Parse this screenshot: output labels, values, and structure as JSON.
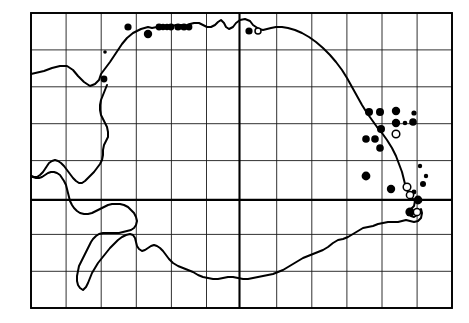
{
  "figure": {
    "name": "species-distribution-map",
    "width": 469,
    "height": 323,
    "background_color": "#ffffff",
    "line_color": "#000000"
  },
  "graticule": {
    "columns": 12,
    "rows": 8,
    "left": 31,
    "top": 13,
    "right": 452,
    "bottom": 308,
    "cell_width": 35.1,
    "cell_height": 36.9,
    "minor_color": "#1a1a1a",
    "major_color": "#000000",
    "major_vertical_x": [
      239.5
    ],
    "major_horizontal_y": [
      199.9
    ],
    "x_lines": [
      31,
      66.1,
      101.2,
      136.3,
      171.4,
      206.5,
      239.5,
      276.7,
      311.8,
      346.9,
      382.0,
      417.1,
      452
    ],
    "y_lines": [
      13,
      49.9,
      86.8,
      123.7,
      160.6,
      199.9,
      234.4,
      271.3,
      308
    ]
  },
  "coastline": {
    "name": "landmass-outline",
    "stroke_width": 2.0,
    "path": "M 31 74 L 44 71 L 52 68 L 60 66 L 67 66 L 73 70 L 78 76 L 84 82 L 90 86 L 95 84 L 99 80 L 101 74 L 104 70 L 107 66 L 110 62 L 114 56 L 118 50 L 122 44 L 127 38 L 133 33 L 141 29 L 148 27 L 152 28 L 157 27 L 163 26 L 168 27 L 172 26 L 176 25 L 181 25 L 186 26 L 190 24 L 194 23 L 199 23 L 203 25 L 207 27 L 211 27 L 215 25 L 218 22 L 221 20 L 224 23 L 226 27 L 229 29 L 233 27 L 236 23 L 240 20 L 245 19 L 250 21 L 253 25 L 256 27 L 259 29 L 263 30 L 267 29 L 271 28 L 276 27 L 282 27 L 288 28 L 295 30 L 302 33 L 309 37 L 316 42 L 323 48 L 330 55 L 336 62 L 342 70 L 347 78 L 352 87 L 357 96 L 362 105 L 367 113 L 372 120 L 377 127 L 382 133 L 387 140 L 392 148 L 396 156 L 399 164 L 402 172 L 404 180 L 406 188 L 409 194 L 412 198 L 415 201 L 414 206 L 411 209 L 409 213 L 411 216 L 414 217 L 417 215 L 419 212 L 421 209 L 422 213 L 421 218 L 418 221 L 414 222 L 410 221 L 406 220 L 402 221 L 398 222 L 393 222 L 388 222 L 383 223 L 378 224 L 373 226 L 368 227 L 363 228 L 358 231 L 353 234 L 348 237 L 343 239 L 338 240 L 333 243 L 328 247 L 323 250 L 318 252 L 313 254 L 308 256 L 303 258 L 298 261 L 293 264 L 288 267 L 283 270 L 278 272 L 273 274 L 268 275 L 263 276 L 258 277 L 253 278 L 248 279 L 243 279 L 238 278 L 233 277 L 228 277 L 223 278 L 218 279 L 213 279 L 208 278 L 203 277 L 198 275 L 193 272 L 188 270 L 183 268 L 178 266 L 173 263 L 169 259 L 166 255 L 163 251 L 160 248 L 157 246 L 154 245 L 151 246 L 148 248 L 145 250 L 142 251 L 139 249 L 137 246 L 136 242 L 135 238 L 133 235 L 130 234 L 126 235 L 122 237 L 118 240 L 114 244 L 110 248 L 106 253 L 102 258 L 98 263 L 95 268 L 92 273 L 90 278 L 88 283 L 86 287 L 83 290 L 80 288 L 78 285 L 77 281 L 77 276 L 78 271 L 79 266 L 81 262 L 83 258 L 85 254 L 87 250 L 89 246 L 91 242 L 93 239 L 96 236 L 99 234 L 103 233 L 107 233 L 111 233 L 115 233 L 119 233 L 123 232 L 127 231 L 131 230 L 134 228 L 136 225 L 137 221 L 136 217 L 134 213 L 131 210 L 128 207 L 124 205 L 120 204 L 116 204 L 112 204 L 108 205 L 104 207 L 100 209 L 96 211 L 92 213 L 88 214 L 84 214 L 80 213 L 77 211 L 74 208 L 72 205 L 70 201 L 69 197 L 68 193 L 67 189 L 66 185 L 64 181 L 62 178 L 60 175 L 57 173 L 54 172 L 51 172 L 48 173 L 45 175 L 42 177 L 39 178 L 36 178 L 33 177 L 31 176",
    "coastline_inland_path": "M 31 176 L 34 177 L 37 177 L 40 175 L 43 172 L 45 169 L 47 166 L 49 163 L 52 161 L 55 160 L 58 161 L 61 163 L 64 166 L 67 170 L 70 174 L 73 178 L 76 181 L 79 183 L 82 183 L 85 181 L 88 178 L 91 175 L 94 172 L 97 168 L 100 164 L 102 160 L 103 155 L 103 150 L 104 145 L 106 141 L 108 137 L 108 132 L 107 127 L 105 123 L 103 119 L 101 115 L 100 110 L 100 105 L 101 100 L 103 95 L 105 90 L 107 85"
  },
  "points": {
    "filled_label": "filled-circle-record",
    "open_label": "open-circle-record",
    "filled_color": "#000000",
    "open_fill_color": "#ffffff",
    "filled": [
      {
        "x": 128,
        "y": 27,
        "r": 3.6
      },
      {
        "x": 148,
        "y": 34,
        "r": 4.2
      },
      {
        "x": 159,
        "y": 27,
        "r": 3.4
      },
      {
        "x": 163,
        "y": 27,
        "r": 3.2
      },
      {
        "x": 167,
        "y": 27,
        "r": 3.2
      },
      {
        "x": 171,
        "y": 27,
        "r": 3.4
      },
      {
        "x": 178,
        "y": 27,
        "r": 3.6
      },
      {
        "x": 184,
        "y": 27,
        "r": 3.6
      },
      {
        "x": 189,
        "y": 27,
        "r": 3.4
      },
      {
        "x": 249,
        "y": 31,
        "r": 3.6
      },
      {
        "x": 105,
        "y": 52,
        "r": 1.8
      },
      {
        "x": 104,
        "y": 79,
        "r": 3.4
      },
      {
        "x": 369,
        "y": 112,
        "r": 4.0
      },
      {
        "x": 380,
        "y": 112,
        "r": 4.0
      },
      {
        "x": 396,
        "y": 111,
        "r": 4.2
      },
      {
        "x": 414,
        "y": 113,
        "r": 2.6
      },
      {
        "x": 396,
        "y": 123,
        "r": 4.2
      },
      {
        "x": 405,
        "y": 123,
        "r": 2.3
      },
      {
        "x": 413,
        "y": 122,
        "r": 3.8
      },
      {
        "x": 381,
        "y": 129,
        "r": 4.0
      },
      {
        "x": 366,
        "y": 139,
        "r": 3.8
      },
      {
        "x": 375,
        "y": 139,
        "r": 3.8
      },
      {
        "x": 380,
        "y": 148,
        "r": 3.8
      },
      {
        "x": 420,
        "y": 166,
        "r": 2.2
      },
      {
        "x": 426,
        "y": 176,
        "r": 2.2
      },
      {
        "x": 366,
        "y": 176,
        "r": 4.4
      },
      {
        "x": 423,
        "y": 184,
        "r": 3.0
      },
      {
        "x": 391,
        "y": 189,
        "r": 4.2
      },
      {
        "x": 414,
        "y": 192,
        "r": 2.4
      },
      {
        "x": 418,
        "y": 200,
        "r": 4.4
      },
      {
        "x": 410,
        "y": 212,
        "r": 4.6
      }
    ],
    "open": [
      {
        "x": 258,
        "y": 31,
        "r": 3.0
      },
      {
        "x": 396,
        "y": 134,
        "r": 3.8
      },
      {
        "x": 407,
        "y": 187,
        "r": 3.8
      },
      {
        "x": 410,
        "y": 195,
        "r": 3.6
      },
      {
        "x": 417,
        "y": 212,
        "r": 3.6
      }
    ]
  }
}
